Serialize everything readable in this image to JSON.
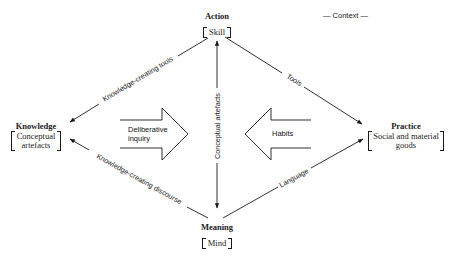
{
  "diagram": {
    "context_label": "— Context —",
    "nodes": {
      "action": {
        "title": "Action",
        "subtitle": "Skill"
      },
      "knowledge": {
        "title": "Knowledge",
        "subtitle_line1": "Conceptual",
        "subtitle_line2": "artefacts"
      },
      "practice": {
        "title": "Practice",
        "subtitle_line1": "Social and material",
        "subtitle_line2": "goods"
      },
      "meaning": {
        "title": "Meaning",
        "subtitle": "Mind"
      }
    },
    "edges": [
      {
        "from": "Action",
        "to": "Knowledge",
        "label": "Knowledge-creating tools"
      },
      {
        "from": "Action",
        "to": "Practice",
        "label": "Tools"
      },
      {
        "from": "Meaning",
        "to": "Knowledge",
        "label": "Knowledge-creating discourse"
      },
      {
        "from": "Meaning",
        "to": "Practice",
        "label": "Language"
      },
      {
        "from": "Action",
        "to": "Meaning",
        "label": "Conceptual artefacts",
        "bidirectional": true
      }
    ],
    "block_arrows": {
      "left": {
        "label_line1": "Deliberative",
        "label_line2": "inquiry",
        "direction": "right"
      },
      "right": {
        "label": "Habits",
        "direction": "left"
      }
    },
    "colors": {
      "line": "#1a1a1a",
      "background": "#ffffff"
    }
  }
}
